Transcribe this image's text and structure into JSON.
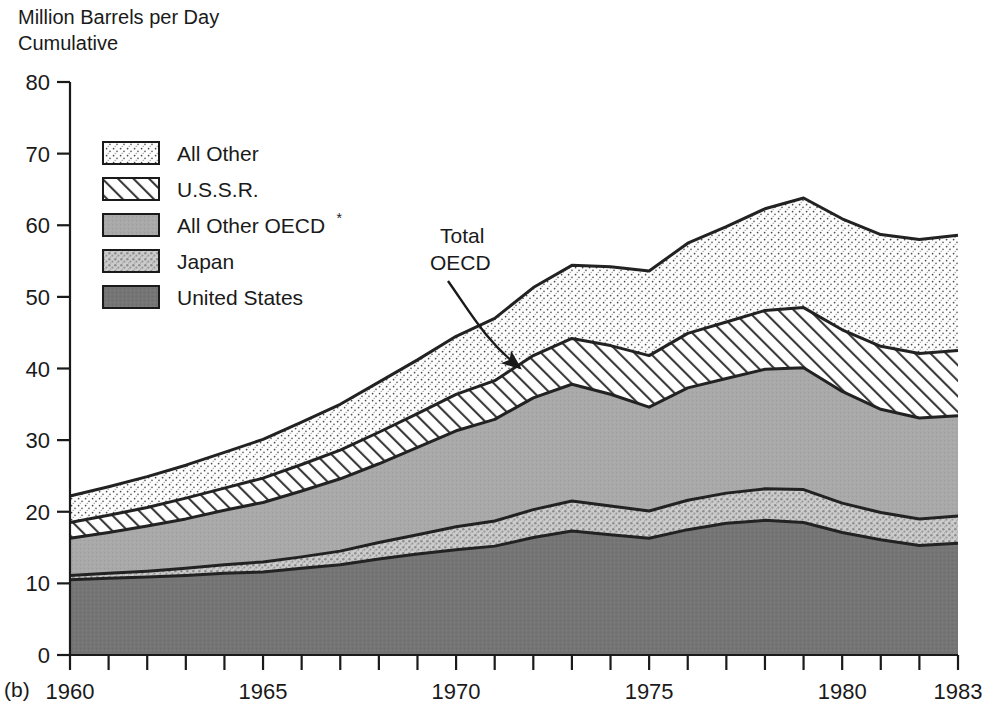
{
  "figure": {
    "panel_label": "(b)",
    "axis_title_line1": "Million Barrels per Day",
    "axis_title_line2": "Cumulative"
  },
  "annotation": {
    "line1": "Total",
    "line2": "OECD"
  },
  "legend": {
    "items": [
      {
        "label": "All Other",
        "fill": "#fdfdfd",
        "pattern": "fine-dots",
        "sup": ""
      },
      {
        "label": "U.S.S.R.",
        "fill": "#ffffff",
        "pattern": "diagonal-hatch",
        "sup": ""
      },
      {
        "label": "All Other OECD",
        "fill": "#a9a9a9",
        "pattern": "solid-gray",
        "sup": "*"
      },
      {
        "label": "Japan",
        "fill": "#c4c4c4",
        "pattern": "coarse-speckle",
        "sup": ""
      },
      {
        "label": "United States",
        "fill": "#757575",
        "pattern": "solid-dark",
        "sup": ""
      }
    ]
  },
  "chart_data": {
    "type": "area",
    "stacked": true,
    "title": "Million Barrels per Day Cumulative",
    "xlabel": "",
    "ylabel": "Million Barrels per Day Cumulative",
    "xlim": [
      1960,
      1983
    ],
    "ylim": [
      0,
      80
    ],
    "ytick_labels": [
      "0",
      "10",
      "20",
      "30",
      "40",
      "50",
      "60",
      "70",
      "80"
    ],
    "yticks": [
      0,
      10,
      20,
      30,
      40,
      50,
      60,
      70,
      80
    ],
    "xtick_labels": [
      "1960",
      "1965",
      "1970",
      "1975",
      "1980",
      "1983"
    ],
    "xticks_labeled": [
      1960,
      1965,
      1970,
      1975,
      1980,
      1983
    ],
    "xticks_minor": [
      1961,
      1962,
      1963,
      1964,
      1966,
      1967,
      1968,
      1969,
      1971,
      1972,
      1973,
      1974,
      1976,
      1977,
      1978,
      1979,
      1981,
      1982
    ],
    "grid": false,
    "legend_position": "upper-left-inside",
    "x": [
      1960,
      1961,
      1962,
      1963,
      1964,
      1965,
      1966,
      1967,
      1968,
      1969,
      1970,
      1971,
      1972,
      1973,
      1974,
      1975,
      1976,
      1977,
      1978,
      1979,
      1980,
      1981,
      1982,
      1983
    ],
    "series": [
      {
        "name": "United States",
        "fill": "#757575",
        "pattern": "solid-dark",
        "values": [
          10.5,
          10.7,
          10.9,
          11.1,
          11.4,
          11.6,
          12.1,
          12.6,
          13.4,
          14.1,
          14.7,
          15.2,
          16.4,
          17.3,
          16.8,
          16.3,
          17.5,
          18.4,
          18.8,
          18.5,
          17.1,
          16.1,
          15.3,
          15.6
        ],
        "units": "million barrels per day"
      },
      {
        "name": "Japan",
        "fill": "#c4c4c4",
        "pattern": "coarse-speckle",
        "values": [
          0.6,
          0.7,
          0.8,
          1.0,
          1.2,
          1.4,
          1.6,
          1.9,
          2.3,
          2.7,
          3.2,
          3.5,
          3.9,
          4.2,
          4.0,
          3.8,
          4.1,
          4.2,
          4.4,
          4.6,
          4.1,
          3.8,
          3.7,
          3.8
        ],
        "units": "million barrels per day"
      },
      {
        "name": "All Other OECD",
        "fill": "#a9a9a9",
        "pattern": "solid-gray",
        "values": [
          5.2,
          5.7,
          6.3,
          6.9,
          7.6,
          8.3,
          9.2,
          10.1,
          11.0,
          12.2,
          13.4,
          14.2,
          15.6,
          16.3,
          15.6,
          14.5,
          15.7,
          16.0,
          16.7,
          17.0,
          15.6,
          14.4,
          14.1,
          14.0
        ],
        "units": "million barrels per day"
      },
      {
        "name": "U.S.S.R.",
        "fill": "#ffffff",
        "pattern": "diagonal-hatch",
        "values": [
          2.2,
          2.4,
          2.6,
          2.9,
          3.1,
          3.4,
          3.7,
          4.0,
          4.4,
          4.7,
          5.1,
          5.4,
          5.9,
          6.4,
          6.8,
          7.2,
          7.6,
          7.9,
          8.2,
          8.4,
          8.6,
          8.8,
          9.0,
          9.1
        ],
        "units": "million barrels per day"
      },
      {
        "name": "All Other",
        "fill": "#fdfdfd",
        "pattern": "fine-dots",
        "values": [
          3.7,
          4.0,
          4.3,
          4.6,
          5.0,
          5.4,
          5.9,
          6.4,
          7.0,
          7.5,
          8.1,
          8.7,
          9.5,
          10.2,
          11.0,
          11.8,
          12.6,
          13.3,
          14.2,
          15.3,
          15.5,
          15.6,
          15.9,
          16.1
        ],
        "units": "million barrels per day"
      }
    ],
    "cumulative_totals": [
      22.2,
      23.5,
      24.9,
      26.5,
      28.3,
      30.1,
      32.5,
      35.0,
      38.1,
      41.2,
      44.5,
      47.0,
      51.3,
      54.4,
      54.2,
      53.6,
      57.5,
      59.8,
      62.3,
      63.8,
      60.9,
      58.7,
      58.0,
      58.6
    ],
    "annotations": [
      {
        "text": "Total OECD",
        "points_to_year": 1973,
        "points_to_value": 40.0
      }
    ]
  }
}
